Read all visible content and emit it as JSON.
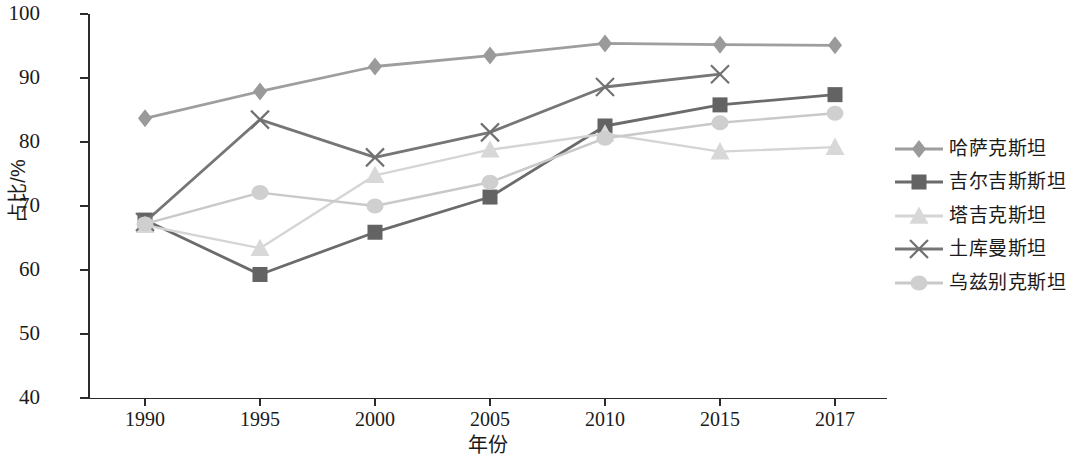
{
  "chart_data": {
    "type": "line",
    "title": "",
    "xlabel": "年份",
    "ylabel": "占比/%",
    "x": [
      "1990",
      "1995",
      "2000",
      "2005",
      "2010",
      "2015",
      "2017"
    ],
    "xlim": [
      0,
      6
    ],
    "ylim": [
      40,
      100
    ],
    "y_ticks": [
      "40",
      "50",
      "60",
      "70",
      "80",
      "90",
      "100"
    ],
    "grid": false,
    "legend_position": "right",
    "series": [
      {
        "name": "哈萨克斯坦",
        "marker": "diamond",
        "color": "#9a9a9a",
        "line_color": "#9e9e9e",
        "values": [
          83.7,
          87.9,
          91.8,
          93.5,
          95.4,
          95.2,
          95.1
        ]
      },
      {
        "name": "吉尔吉斯斯坦",
        "marker": "square",
        "color": "#636363",
        "line_color": "#6b6b6b",
        "values": [
          67.8,
          59.3,
          65.9,
          71.4,
          82.5,
          85.8,
          87.4
        ]
      },
      {
        "name": "塔吉克斯坦",
        "marker": "triangle",
        "color": "#d8d8d8",
        "line_color": "#d5d5d5",
        "values": [
          67.0,
          63.4,
          74.8,
          78.8,
          81.3,
          78.5,
          79.2
        ]
      },
      {
        "name": "土库曼斯坦",
        "marker": "x",
        "color": "#707070",
        "line_color": "#767676",
        "values": [
          67.5,
          83.5,
          77.6,
          81.5,
          88.6,
          90.6,
          null
        ]
      },
      {
        "name": "乌兹别克斯坦",
        "marker": "circle",
        "color": "#cfcfcf",
        "line_color": "#c9c9c9",
        "values": [
          67.2,
          72.1,
          70.0,
          73.7,
          80.6,
          83.0,
          84.5
        ]
      }
    ]
  },
  "axes": {
    "y_title": "占比/%",
    "x_title": "年份",
    "y_tick_labels": [
      "100",
      "90",
      "80",
      "70",
      "60",
      "50",
      "40"
    ],
    "x_tick_labels": [
      "1990",
      "1995",
      "2000",
      "2005",
      "2010",
      "2015",
      "2017"
    ]
  },
  "legend": {
    "items": [
      {
        "label": "哈萨克斯坦",
        "marker": "diamond-marker"
      },
      {
        "label": "吉尔吉斯斯坦",
        "marker": "square-marker"
      },
      {
        "label": "塔吉克斯坦",
        "marker": "triangle-marker"
      },
      {
        "label": "土库曼斯坦",
        "marker": "x-marker"
      },
      {
        "label": "乌兹别克斯坦",
        "marker": "circle-marker"
      }
    ]
  }
}
